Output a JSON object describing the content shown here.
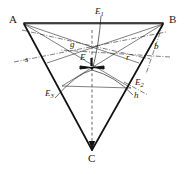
{
  "figure": {
    "type": "geometry-diagram",
    "background_color": "#ffffff",
    "stroke_color": "#1a1a1a",
    "vertices": [
      {
        "name": "A",
        "label": "A",
        "x": 24,
        "y": 24,
        "label_x": 9,
        "label_y": 14
      },
      {
        "name": "B",
        "label": "B",
        "x": 163,
        "y": 24,
        "label_x": 169,
        "label_y": 14
      },
      {
        "name": "C",
        "label": "C",
        "x": 92,
        "y": 150,
        "label_x": 88,
        "label_y": 153
      }
    ],
    "points": [
      {
        "name": "E",
        "label": "E",
        "sub": "",
        "x": 92,
        "y": 68,
        "label_x": 80,
        "label_y": 53
      },
      {
        "name": "E1",
        "label": "E",
        "sub": "1",
        "x": 101,
        "y": 24,
        "label_x": 95,
        "label_y": 7
      },
      {
        "name": "E2",
        "label": "E",
        "sub": "2",
        "x": 131,
        "y": 88,
        "label_x": 135,
        "label_y": 78
      },
      {
        "name": "E3",
        "label": "E",
        "sub": "3",
        "x": 62,
        "y": 86,
        "label_x": 45,
        "label_y": 89
      }
    ],
    "line_labels": [
      {
        "name": "g",
        "label": "g",
        "x": 70,
        "y": 40
      },
      {
        "name": "s",
        "label": "s",
        "x": 25,
        "y": 55
      },
      {
        "name": "b",
        "label": "b",
        "x": 154,
        "y": 42
      },
      {
        "name": "r",
        "label": "r",
        "x": 126,
        "y": 53
      },
      {
        "name": "h",
        "label": "h",
        "x": 134,
        "y": 91
      }
    ],
    "strokes": {
      "triangle_side_width": 1.7,
      "thin_width": 0.6,
      "dashdot_pattern": "5 1.6 1 1.6",
      "dashed_pattern": "3 2.4"
    }
  }
}
